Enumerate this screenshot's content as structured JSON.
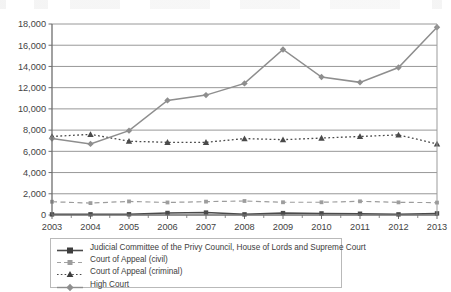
{
  "chart_data": {
    "type": "line",
    "title": "",
    "subtitle": "",
    "xlabel": "",
    "ylabel": "",
    "categories": [
      "2003",
      "2004",
      "2005",
      "2006",
      "2007",
      "2008",
      "2009",
      "2010",
      "2011",
      "2012",
      "2013"
    ],
    "ylim": [
      0,
      18000
    ],
    "ytick_values": [
      0,
      2000,
      4000,
      6000,
      8000,
      10000,
      12000,
      14000,
      16000,
      18000
    ],
    "ytick_labels": [
      "0",
      "2,000",
      "4,000",
      "6,000",
      "8,000",
      "10,000",
      "12,000",
      "14,000",
      "16,000",
      "18,000"
    ],
    "grid": "horizontal",
    "legend_position": "bottom",
    "series": [
      {
        "name": "Judicial Committee of the Privy Council, House of Lords and Supreme Court",
        "values": [
          60,
          65,
          70,
          190,
          230,
          60,
          180,
          150,
          120,
          60,
          150
        ],
        "color": "#4a4a4a",
        "line_style": "solid",
        "marker": "square"
      },
      {
        "name": "Court of Appeal (civil)",
        "values": [
          1250,
          1120,
          1280,
          1180,
          1260,
          1320,
          1200,
          1200,
          1290,
          1190,
          1170
        ],
        "color": "#9d9d9d",
        "line_style": "dashed",
        "marker": "square"
      },
      {
        "name": "Court of Appeal (criminal)",
        "values": [
          7400,
          7600,
          6950,
          6850,
          6850,
          7200,
          7100,
          7250,
          7400,
          7550,
          6700
        ],
        "color": "#4a4a4a",
        "line_style": "dotted",
        "marker": "triangle"
      },
      {
        "name": "High Court",
        "values": [
          7200,
          6700,
          7950,
          10800,
          11300,
          12400,
          15600,
          13000,
          12500,
          13900,
          17700
        ],
        "color": "#8e8e8e",
        "line_style": "solid",
        "marker": "diamond"
      }
    ]
  },
  "legend": {
    "entries": [
      "Judicial Committee of the Privy Council, House of Lords and Supreme Court",
      "Court of Appeal (civil)",
      "Court of Appeal (criminal)",
      "High Court"
    ]
  },
  "colors": {
    "axis": "#6e6e6e",
    "grid": "#8c8c8c",
    "text": "#3d3d3d",
    "plot_background": "#ffffff"
  }
}
